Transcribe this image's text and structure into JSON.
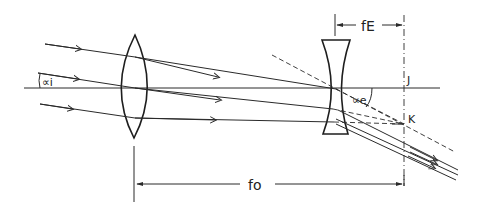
{
  "diagram": {
    "type": "optics-ray-diagram",
    "labels": {
      "alpha_i": "∝i",
      "alpha_e": "∝e",
      "point_j": "J",
      "point_k": "K",
      "f_objective": "fo",
      "f_eyepiece": "fE"
    },
    "elements": [
      {
        "name": "objective-lens",
        "kind": "convex",
        "center_x": 135
      },
      {
        "name": "eyepiece-lens",
        "kind": "concave",
        "center_x": 336
      },
      {
        "name": "optical-axis",
        "kind": "line",
        "y": 88
      },
      {
        "name": "focal-plane",
        "kind": "dashed-vertical",
        "x": 404
      }
    ],
    "dimensions": [
      {
        "label": "fo",
        "from_x": 134,
        "to_x": 404
      },
      {
        "label": "fE",
        "from_x": 335,
        "to_x": 404
      }
    ],
    "colors": {
      "ink": "#2a2a2a",
      "background": "#ffffff"
    }
  }
}
